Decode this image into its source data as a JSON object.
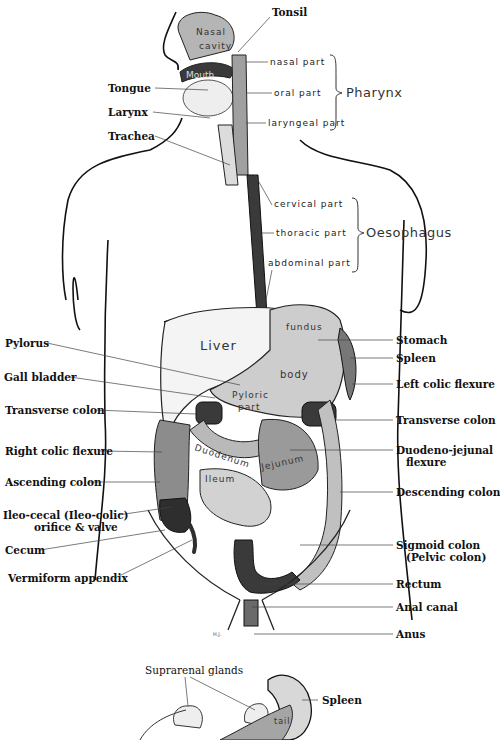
{
  "diagram": {
    "head_labels": {
      "tonsil": "Tonsil",
      "tongue": "Tongue",
      "larynx": "Larynx",
      "trachea": "Trachea"
    },
    "pharynx": {
      "group": "Pharynx",
      "parts": [
        "nasal part",
        "oral part",
        "laryngeal part"
      ]
    },
    "oesophagus": {
      "group": "Oesophagus",
      "parts": [
        "cervical part",
        "thoracic part",
        "abdominal part"
      ]
    },
    "organ_text": {
      "nasal_cavity_1": "Nasal",
      "nasal_cavity_2": "cavity",
      "mouth": "Mouth",
      "liver": "Liver",
      "fundus": "fundus",
      "body": "body",
      "pyloric_1": "Pyloric",
      "pyloric_2": "part",
      "duodenum": "Duodenum",
      "jejunum": "Jejunum",
      "ileum": "Ileum",
      "tail": "tail",
      "artist_mark": "H.J."
    },
    "left_labels": [
      "Pylorus",
      "Gall bladder",
      "Transverse colon",
      "Right colic flexure",
      "Ascending colon",
      "Ileo-cecal (Ileo-colic)",
      "orifice & valve",
      "Cecum",
      "Vermiform appendix"
    ],
    "right_labels": [
      "Stomach",
      "Spleen",
      "Left colic flexure",
      "Transverse colon",
      "Duodeno-jejunal",
      "flexure",
      "Descending colon",
      "Sigmoid colon",
      "(Pelvic colon)",
      "Rectum",
      "Anal canal",
      "Anus"
    ],
    "lower_figure": {
      "suprarenal": "Suprarenal glands",
      "spleen": "Spleen"
    },
    "colors": {
      "dark": "#3a3a3a",
      "mid": "#8a8a8a",
      "light": "#c8c8c8",
      "pale": "#e2e2e2"
    }
  }
}
